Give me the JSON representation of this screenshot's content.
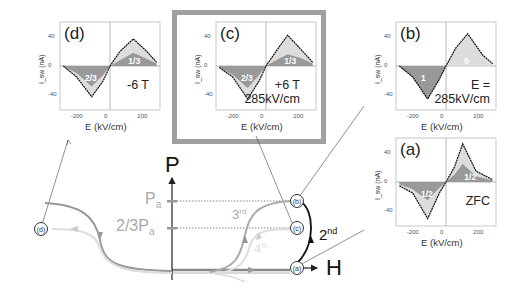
{
  "figure": {
    "phase_diagram": {
      "y_axis_label": "P",
      "x_axis_label": "H",
      "levels": [
        {
          "label": "P",
          "subscript": "a"
        },
        {
          "label": "2/3P",
          "subscript": "a"
        }
      ],
      "curve_labels": {
        "second": {
          "text": "2",
          "sup": "nd"
        },
        "third": {
          "text": "3",
          "sup": "rd"
        },
        "fourth": {
          "text": "4",
          "sup": "th"
        }
      },
      "nodes": [
        "(a)",
        "(b)",
        "(c)",
        "(d)"
      ]
    },
    "panels": [
      {
        "id": "d",
        "title": "(d)",
        "annotation": "-6 T",
        "area_labels": [
          "2/3",
          "1/3"
        ]
      },
      {
        "id": "c",
        "title": "(c)",
        "annotation": "+6 T\n285kV/cm",
        "area_labels": [
          "2/3",
          "1/3"
        ],
        "highlighted": true
      },
      {
        "id": "b",
        "title": "(b)",
        "annotation": "E =\n285kV/cm",
        "area_labels": [
          "1",
          "0"
        ]
      },
      {
        "id": "a",
        "title": "(a)",
        "annotation": "ZFC",
        "area_labels": [
          "1/2",
          "1/2"
        ]
      }
    ],
    "axes": {
      "xlabel": "E (kV/cm)",
      "ylabel": "I_sw (nA)",
      "x_ticks": [
        "-200",
        "0",
        "200"
      ],
      "y_ticks": [
        "40",
        "0",
        "-40"
      ]
    }
  },
  "chart_data": [
    {
      "type": "area",
      "title": "(d) -6 T",
      "xlabel": "E (kV/cm)",
      "ylabel": "I_sw (nA)",
      "xlim": [
        -300,
        300
      ],
      "ylim": [
        -60,
        60
      ],
      "series": [
        {
          "name": "total",
          "x": [
            -280,
            -200,
            -110,
            -40,
            0,
            60,
            140,
            220,
            280
          ],
          "y": [
            0,
            -15,
            -42,
            -20,
            0,
            20,
            37,
            20,
            5
          ]
        },
        {
          "name": "2/3 / 1/3 fraction",
          "x": [
            -280,
            -200,
            -110,
            -40,
            0,
            60,
            140,
            220,
            280
          ],
          "y": [
            0,
            -10,
            -28,
            -12,
            0,
            8,
            18,
            10,
            3
          ]
        }
      ]
    },
    {
      "type": "area",
      "title": "(c) +6 T 285kV/cm",
      "xlabel": "E (kV/cm)",
      "ylabel": "I_sw (nA)",
      "xlim": [
        -300,
        300
      ],
      "ylim": [
        -60,
        60
      ],
      "series": [
        {
          "name": "total",
          "x": [
            -280,
            -200,
            -110,
            -40,
            0,
            60,
            130,
            220,
            280
          ],
          "y": [
            -2,
            -15,
            -45,
            -20,
            0,
            20,
            42,
            20,
            5
          ]
        },
        {
          "name": "2/3 / 1/3 fraction",
          "x": [
            -280,
            -200,
            -110,
            -40,
            0,
            60,
            130,
            220,
            280
          ],
          "y": [
            -2,
            -12,
            -30,
            -12,
            0,
            8,
            16,
            10,
            3
          ]
        }
      ]
    },
    {
      "type": "area",
      "title": "(b) E = 285kV/cm",
      "xlabel": "E (kV/cm)",
      "ylabel": "I_sw (nA)",
      "xlim": [
        -300,
        300
      ],
      "ylim": [
        -60,
        60
      ],
      "series": [
        {
          "name": "total",
          "x": [
            -280,
            -200,
            -110,
            -40,
            0,
            60,
            130,
            220,
            280
          ],
          "y": [
            0,
            -15,
            -45,
            -18,
            0,
            25,
            44,
            15,
            3
          ]
        },
        {
          "name": "fraction (1 / 0)",
          "x": [
            -280,
            -200,
            -110,
            -40,
            0,
            60,
            130,
            220,
            280
          ],
          "y": [
            0,
            -15,
            -45,
            -18,
            0,
            0,
            0,
            0,
            0
          ]
        }
      ]
    },
    {
      "type": "area",
      "title": "(a) ZFC",
      "xlabel": "E (kV/cm)",
      "ylabel": "I_sw (nA)",
      "xlim": [
        -300,
        300
      ],
      "ylim": [
        -60,
        60
      ],
      "series": [
        {
          "name": "total",
          "x": [
            -280,
            -200,
            -110,
            -40,
            0,
            50,
            100,
            180,
            280
          ],
          "y": [
            -5,
            -15,
            -50,
            -15,
            0,
            20,
            52,
            15,
            3
          ]
        },
        {
          "name": "1/2 fraction",
          "x": [
            -280,
            -200,
            -110,
            -40,
            0,
            50,
            100,
            180,
            280
          ],
          "y": [
            -3,
            -10,
            -25,
            -8,
            0,
            10,
            25,
            8,
            2
          ]
        }
      ]
    }
  ]
}
